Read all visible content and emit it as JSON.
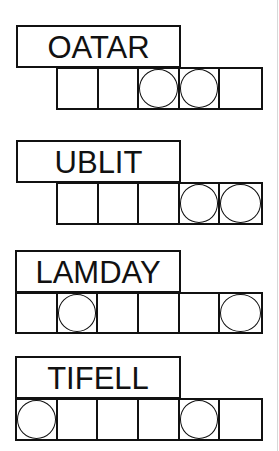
{
  "puzzles": [
    {
      "scrambled": "OATAR",
      "cell_count": 5,
      "circled_positions": [
        3,
        4
      ],
      "cells": [
        {
          "index": 1,
          "circled": false
        },
        {
          "index": 2,
          "circled": false
        },
        {
          "index": 3,
          "circled": true
        },
        {
          "index": 4,
          "circled": true
        },
        {
          "index": 5,
          "circled": false
        }
      ]
    },
    {
      "scrambled": "UBLIT",
      "cell_count": 5,
      "circled_positions": [
        4,
        5
      ],
      "cells": [
        {
          "index": 1,
          "circled": false
        },
        {
          "index": 2,
          "circled": false
        },
        {
          "index": 3,
          "circled": false
        },
        {
          "index": 4,
          "circled": true
        },
        {
          "index": 5,
          "circled": true
        }
      ]
    },
    {
      "scrambled": "LAMDAY",
      "cell_count": 6,
      "circled_positions": [
        2,
        6
      ],
      "cells": [
        {
          "index": 1,
          "circled": false
        },
        {
          "index": 2,
          "circled": true
        },
        {
          "index": 3,
          "circled": false
        },
        {
          "index": 4,
          "circled": false
        },
        {
          "index": 5,
          "circled": false
        },
        {
          "index": 6,
          "circled": true
        }
      ]
    },
    {
      "scrambled": "TIFELL",
      "cell_count": 6,
      "circled_positions": [
        1,
        5
      ],
      "cells": [
        {
          "index": 1,
          "circled": true
        },
        {
          "index": 2,
          "circled": false
        },
        {
          "index": 3,
          "circled": false
        },
        {
          "index": 4,
          "circled": false
        },
        {
          "index": 5,
          "circled": true
        },
        {
          "index": 6,
          "circled": false
        }
      ]
    }
  ]
}
